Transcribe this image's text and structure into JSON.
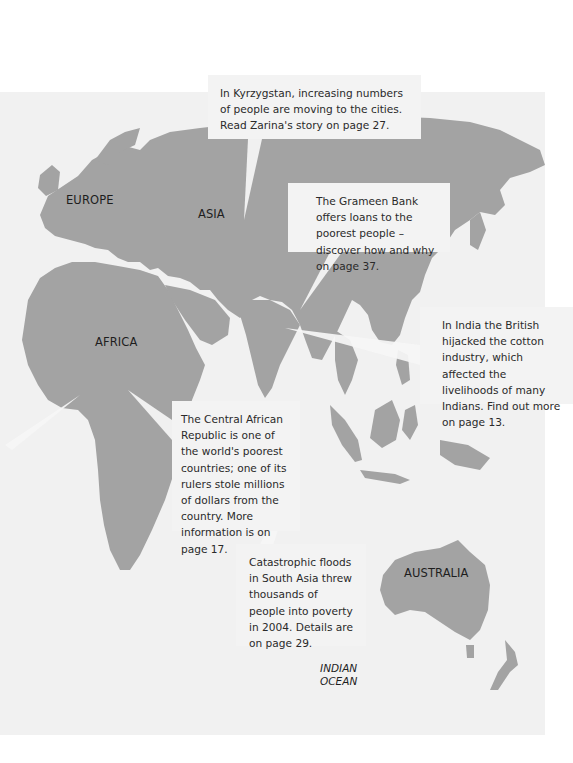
{
  "map": {
    "colors": {
      "ocean": "#f1f1f1",
      "land": "#a3a3a3",
      "callout": "#f3f3f3",
      "text": "#2a2a2a"
    },
    "region_labels": {
      "europe": "EUROPE",
      "asia": "ASIA",
      "africa": "AFRICA",
      "australia": "AUSTRALIA"
    },
    "ocean_label": {
      "line1": "INDIAN",
      "line2": "OCEAN"
    }
  },
  "callouts": {
    "kyrzygstan": "In Kyrzygstan, increasing numbers of people are moving to the cities. Read Zarina's story on page 27.",
    "grameen": "The Grameen Bank offers loans to the poorest people – discover how and why on page 37.",
    "india": "In India the British hijacked the cotton industry, which affected the livelihoods of many Indians. Find out more on page 13.",
    "car": "The Central African Republic is one of the world's poorest countries; one of its rulers stole millions of dollars from the country. More information is on page 17.",
    "floods": "Catastrophic floods in South Asia threw thousands of people into poverty in 2004. Details are on page 29."
  }
}
